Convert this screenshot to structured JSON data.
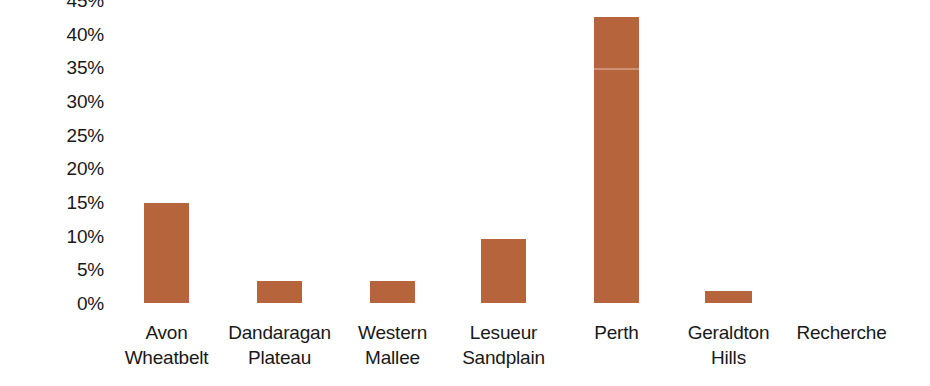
{
  "chart_data": {
    "type": "bar",
    "title": "",
    "subtitle": "",
    "xlabel": "",
    "ylabel": "",
    "categories": [
      "Avon Wheatbelt",
      "Dandaragan Plateau",
      "Western Mallee",
      "Lesueur Sandplain",
      "Perth",
      "Geraldton Hills",
      "Recherche"
    ],
    "category_lines": [
      [
        "Avon",
        "Wheatbelt"
      ],
      [
        "Dandaragan",
        "Plateau"
      ],
      [
        "Western",
        "Mallee"
      ],
      [
        "Lesueur",
        "Sandplain"
      ],
      [
        "Perth",
        ""
      ],
      [
        "Geraldton",
        "Hills"
      ],
      [
        "Recherche",
        ""
      ]
    ],
    "values": [
      14.8,
      3.3,
      3.3,
      9.5,
      42.5,
      1.8,
      0
    ],
    "value_labels": [
      "14.8%",
      "3.3%",
      "3.3%",
      "9.5%",
      "42.5%",
      "1.8%",
      "0%"
    ],
    "ylim": [
      0,
      45
    ],
    "ytick_values": [
      0,
      5,
      10,
      15,
      20,
      25,
      30,
      35,
      40,
      45
    ],
    "ytick_labels": [
      "0%",
      "5%",
      "10%",
      "15%",
      "20%",
      "25%",
      "30%",
      "35%",
      "40%",
      "45%"
    ],
    "grid": false,
    "legend": null,
    "legend_position": "none",
    "series": [
      {
        "name": "",
        "color": "#b5643c",
        "values": [
          14.8,
          3.3,
          3.3,
          9.5,
          42.5,
          1.8,
          0
        ]
      }
    ]
  },
  "colors": {
    "bar": "#b5643c",
    "text": "#191919",
    "background": "#ffffff"
  }
}
